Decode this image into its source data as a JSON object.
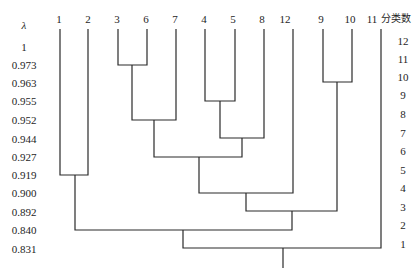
{
  "diagram": {
    "type": "dendrogram",
    "left_axis": {
      "title": "λ",
      "values": [
        "1",
        "0.973",
        "0.963",
        "0.955",
        "0.952",
        "0.944",
        "0.927",
        "0.919",
        "0.900",
        "0.892",
        "0.840",
        "0.831"
      ]
    },
    "right_axis": {
      "title": "分类数",
      "values": [
        "12",
        "11",
        "10",
        "9",
        "8",
        "7",
        "6",
        "5",
        "4",
        "3",
        "2",
        "1"
      ]
    },
    "leaves": [
      "1",
      "2",
      "3",
      "6",
      "7",
      "4",
      "5",
      "8",
      "12",
      "9",
      "10",
      "11"
    ],
    "merges": [
      {
        "clusters": [
          "3",
          "6"
        ],
        "lambda": "0.973"
      },
      {
        "clusters": [
          "9",
          "10"
        ],
        "lambda": "0.963"
      },
      {
        "clusters": [
          "4",
          "5"
        ],
        "lambda": "0.955"
      },
      {
        "clusters": [
          "3,6",
          "7"
        ],
        "lambda": "0.952"
      },
      {
        "clusters": [
          "4,5",
          "8"
        ],
        "lambda": "0.944"
      },
      {
        "clusters": [
          "3,6,7",
          "4,5,8"
        ],
        "lambda": "0.927"
      },
      {
        "clusters": [
          "1",
          "2"
        ],
        "lambda": "0.919"
      },
      {
        "clusters": [
          "3,6,7,4,5,8",
          "12"
        ],
        "lambda": "0.900"
      },
      {
        "clusters": [
          "3,6,7,4,5,8,12",
          "9,10"
        ],
        "lambda": "0.892"
      },
      {
        "clusters": [
          "1,2",
          "3,6,7,4,5,8,12,9,10"
        ],
        "lambda": "0.840"
      },
      {
        "clusters": [
          "1,2,3,6,7,4,5,8,12,9,10",
          "11"
        ],
        "lambda": "0.831"
      }
    ],
    "line_color": "#2a2a2a"
  }
}
